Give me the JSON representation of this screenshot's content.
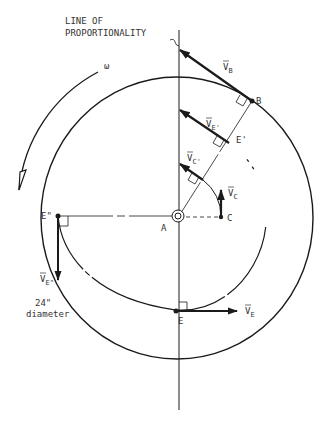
{
  "title_label": {
    "line1": "LINE OF",
    "line2": "PROPORTIONALITY"
  },
  "rotation": {
    "symbol": "ω"
  },
  "points": {
    "A": "A",
    "B": "B",
    "C": "C",
    "E": "E",
    "E_prime": "E'",
    "E_double_prime": "E\""
  },
  "vectors": {
    "V_B": {
      "main": "V",
      "sub": "B"
    },
    "V_E_prime": {
      "main": "V",
      "sub": "E'"
    },
    "V_C_prime": {
      "main": "V",
      "sub": "C'"
    },
    "V_C": {
      "main": "V",
      "sub": "C"
    },
    "V_E": {
      "main": "V",
      "sub": "E"
    },
    "V_E_double_prime": {
      "main": "V",
      "sub": "E\""
    }
  },
  "dimension": {
    "value": "24\"",
    "label": "diameter"
  },
  "colors": {
    "ink": "#1a1a1a",
    "background": "#ffffff"
  }
}
